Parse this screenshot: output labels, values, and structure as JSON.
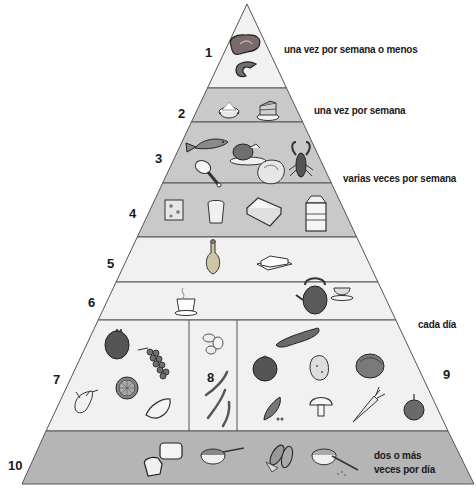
{
  "diagram": {
    "type": "food-pyramid",
    "colors": {
      "light_band": "#f1f1f1",
      "gray_band": "#c9c9c9",
      "base_band": "#b5b5b5",
      "outline": "#555555"
    },
    "levels": [
      {
        "number": "1",
        "frequency": "una vez por semana o menos",
        "foods": [
          "steak",
          "ham-slice"
        ]
      },
      {
        "number": "2",
        "frequency": "una vez por semana",
        "foods": [
          "sugar-bowl",
          "cake-slice"
        ]
      },
      {
        "number": "3",
        "frequency": "varias veces por semana",
        "foods": [
          "fish",
          "roast-chicken",
          "chicken-leg",
          "shrimp",
          "lobster"
        ]
      },
      {
        "number": "4",
        "frequency": "",
        "foods": [
          "cheese",
          "yogurt-cup",
          "egg-carton",
          "milk-carton"
        ]
      },
      {
        "number": "5",
        "frequency": "",
        "foods": [
          "oil-cruet",
          "butter-dish"
        ]
      },
      {
        "number": "6",
        "frequency": "",
        "foods": [
          "coffee-cup",
          "teapot",
          "tea-cup"
        ]
      },
      {
        "number": "7",
        "frequency": "",
        "foods": [
          "apple",
          "grapes",
          "orange-half",
          "banana",
          "melon-slice"
        ]
      },
      {
        "number": "8",
        "frequency": "",
        "foods": [
          "beans",
          "green-beans"
        ]
      },
      {
        "number": "9",
        "frequency": "cada día",
        "foods": [
          "cucumber",
          "tomato",
          "potato",
          "lettuce",
          "peas",
          "mushroom",
          "carrot",
          "onion"
        ]
      },
      {
        "number": "10",
        "frequency": "dos o más veces por día",
        "frequency_lines": [
          "dos o más",
          "veces por día"
        ],
        "foods": [
          "bread",
          "cereal-bowl",
          "corn",
          "rice-bowl"
        ]
      }
    ]
  }
}
